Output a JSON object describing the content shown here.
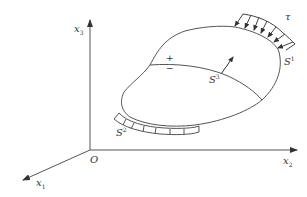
{
  "diagram": {
    "axes": {
      "x1": {
        "base": "x",
        "sub": "1"
      },
      "x2": {
        "base": "x",
        "sub": "2"
      },
      "x3": {
        "base": "x",
        "sub": "3"
      },
      "origin": "O"
    },
    "surfaces": {
      "s1": {
        "base": "S",
        "sup": "1"
      },
      "s2": {
        "base": "S",
        "sup": "2"
      },
      "s3": {
        "base": "S",
        "sup": "3"
      }
    },
    "traction": "τ",
    "signs": {
      "plus": "+",
      "minus": "−"
    },
    "colors": {
      "stroke": "#555555",
      "text": "#333333"
    }
  }
}
